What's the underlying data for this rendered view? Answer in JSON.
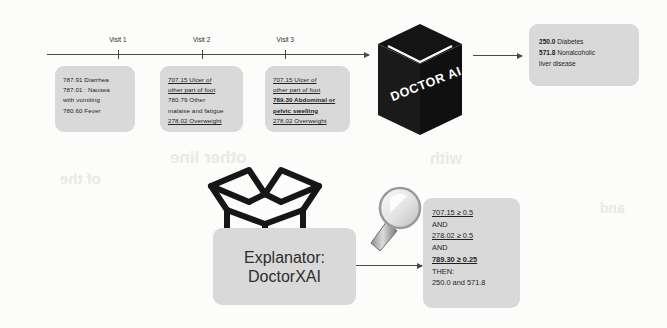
{
  "figure": {
    "background_color": "#fcfcfa",
    "card_color": "#d9d9d9",
    "ink_color": "#2b2b2b",
    "cube_color": "#141414"
  },
  "timeline": {
    "name": "patient-visit-timeline",
    "ticks": [
      {
        "label": "Visit 1",
        "x_pct": 22
      },
      {
        "label": "Visit 2",
        "x_pct": 48
      },
      {
        "label": "Visit 3",
        "x_pct": 74
      }
    ]
  },
  "visits": [
    {
      "name": "visit-1",
      "lines": [
        {
          "text": "787.91  Diarrhea",
          "underline": false,
          "bold": false
        },
        {
          "text": "787.01 : Nausea",
          "underline": false,
          "bold": false
        },
        {
          "text": "with vomiting",
          "underline": false,
          "bold": false
        },
        {
          "text": "780.60  Fever",
          "underline": false,
          "bold": false
        }
      ]
    },
    {
      "name": "visit-2",
      "lines": [
        {
          "text": "707.15 Ulcer of",
          "underline": true,
          "bold": false
        },
        {
          "text": "other part of foot",
          "underline": true,
          "bold": false
        },
        {
          "text": "780.79 Other",
          "underline": false,
          "bold": false
        },
        {
          "text": "malaise and fatigue",
          "underline": false,
          "bold": false
        },
        {
          "text": "278.02 Overweight",
          "underline": true,
          "bold": false
        }
      ]
    },
    {
      "name": "visit-3",
      "lines": [
        {
          "text": "707.15 Ulcer of",
          "underline": true,
          "bold": false
        },
        {
          "text": "other part of foot",
          "underline": true,
          "bold": false
        },
        {
          "text": "789.30 Abdominal or",
          "underline": true,
          "bold": true
        },
        {
          "text": "pelvic swelling",
          "underline": true,
          "bold": true
        },
        {
          "text": "278.02 Overweight",
          "underline": true,
          "bold": false
        }
      ]
    }
  ],
  "model": {
    "name": "doctor-ai",
    "label": "DOCTOR AI"
  },
  "prediction": {
    "name": "prediction-output",
    "lines": [
      {
        "text": "250.0 Diabetes",
        "bold_prefix": "250.0"
      },
      {
        "text": "571.8 Nonalcoholic",
        "bold_prefix": "571.8"
      },
      {
        "text": "liver disease",
        "bold_prefix": ""
      }
    ]
  },
  "explanator": {
    "name": "explanator",
    "label": "Explanator:\nDoctorXAI",
    "icon": "open-box-icon"
  },
  "magnifier": {
    "name": "magnifier-icon"
  },
  "rules": {
    "name": "explanation-rule",
    "lines": [
      {
        "text": "707.15 ≥ 0.5",
        "underline": true,
        "bold": false
      },
      {
        "text": "AND",
        "underline": false,
        "bold": false
      },
      {
        "text": "278.02 ≥ 0.5",
        "underline": true,
        "bold": false
      },
      {
        "text": "AND",
        "underline": false,
        "bold": false
      },
      {
        "text": "789.30 ≥ 0.25",
        "underline": true,
        "bold": true
      },
      {
        "text": "THEN:",
        "underline": false,
        "bold": false
      },
      {
        "text": "250.0 and 571.8",
        "underline": false,
        "bold": false
      }
    ]
  },
  "bleed_artifacts": [
    {
      "text": "other line",
      "x": 170,
      "y": 148,
      "size": 17
    },
    {
      "text": "of the",
      "x": 60,
      "y": 170,
      "size": 15
    },
    {
      "text": "with",
      "x": 430,
      "y": 150,
      "size": 16
    },
    {
      "text": "and",
      "x": 600,
      "y": 200,
      "size": 14
    }
  ]
}
